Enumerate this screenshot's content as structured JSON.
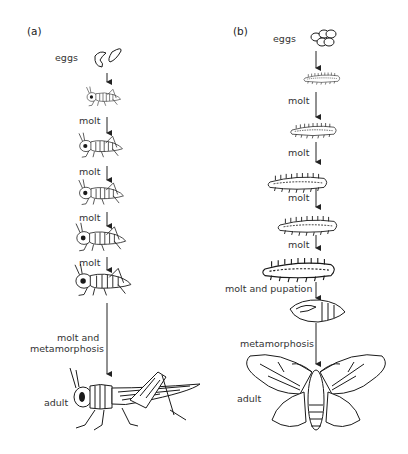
{
  "figure": {
    "panels": [
      {
        "id": "a",
        "label": "(a)",
        "title": "Incomplete metamorphosis (grasshopper)",
        "stages": [
          {
            "label": "eggs"
          },
          {
            "label": "molt"
          },
          {
            "label": "molt"
          },
          {
            "label": "molt"
          },
          {
            "label": "molt"
          },
          {
            "label": "molt and metamorphosis",
            "lines": [
              "molt and",
              "metamorphosis"
            ]
          },
          {
            "label": "adult"
          }
        ]
      },
      {
        "id": "b",
        "label": "(b)",
        "title": "Complete metamorphosis (moth)",
        "stages": [
          {
            "label": "eggs"
          },
          {
            "label": "molt"
          },
          {
            "label": "molt"
          },
          {
            "label": "molt"
          },
          {
            "label": "molt"
          },
          {
            "label": "molt and pupation"
          },
          {
            "label": "metamorphosis"
          },
          {
            "label": "adult"
          }
        ]
      }
    ]
  }
}
